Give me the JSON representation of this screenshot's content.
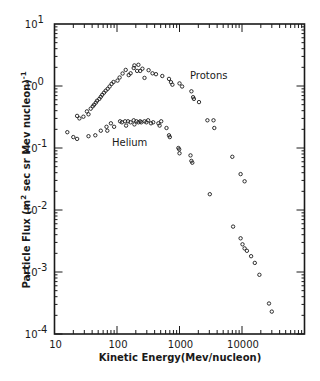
{
  "chart_data": {
    "type": "scatter",
    "title": "",
    "xlabel": "Kinetic Energy (Mev/nucleon)",
    "ylabel": "Particle Flux (m² sec sr Mev nucleon)⁻¹",
    "xscale": "log",
    "yscale": "log",
    "xlim": [
      10,
      100000
    ],
    "ylim": [
      0.0001,
      10
    ],
    "x_ticks": [
      10,
      100,
      1000,
      10000
    ],
    "x_tick_labels": [
      "10",
      "100",
      "1000",
      "10000"
    ],
    "y_ticks": [
      10,
      1,
      0.1,
      0.01,
      0.001,
      0.0001
    ],
    "y_tick_labels": [
      {
        "base": "10",
        "exp": "1"
      },
      {
        "base": "10",
        "exp": "0"
      },
      {
        "base": "10",
        "exp": "-1"
      },
      {
        "base": "10",
        "exp": "-2"
      },
      {
        "base": "10",
        "exp": "-3"
      },
      {
        "base": "10",
        "exp": "-4"
      }
    ],
    "grid": false,
    "legend": "none (inline series labels)",
    "annotations": [
      {
        "text": "Protons",
        "x": 1300,
        "y": 1.2
      },
      {
        "text": "Helium",
        "x": 200,
        "y": 0.115
      }
    ],
    "series": [
      {
        "name": "Protons",
        "marker": "open-circle",
        "points": [
          [
            23,
            0.33
          ],
          [
            25,
            0.3
          ],
          [
            29,
            0.32
          ],
          [
            33,
            0.39
          ],
          [
            35,
            0.35
          ],
          [
            38,
            0.43
          ],
          [
            41,
            0.47
          ],
          [
            43,
            0.5
          ],
          [
            46,
            0.54
          ],
          [
            48,
            0.58
          ],
          [
            52,
            0.62
          ],
          [
            55,
            0.67
          ],
          [
            58,
            0.72
          ],
          [
            62,
            0.78
          ],
          [
            66,
            0.84
          ],
          [
            71,
            0.9
          ],
          [
            76,
            0.98
          ],
          [
            82,
            1.08
          ],
          [
            88,
            1.16
          ],
          [
            102,
            1.22
          ],
          [
            110,
            1.37
          ],
          [
            123,
            1.59
          ],
          [
            138,
            1.82
          ],
          [
            154,
            1.5
          ],
          [
            165,
            1.6
          ],
          [
            185,
            1.95
          ],
          [
            190,
            2.15
          ],
          [
            210,
            1.75
          ],
          [
            220,
            2.2
          ],
          [
            235,
            1.75
          ],
          [
            255,
            1.9
          ],
          [
            275,
            1.35
          ],
          [
            320,
            1.8
          ],
          [
            370,
            1.6
          ],
          [
            420,
            1.55
          ],
          [
            530,
            1.45
          ],
          [
            680,
            1.3
          ],
          [
            730,
            1.15
          ],
          [
            770,
            1.05
          ],
          [
            1000,
            1.1
          ],
          [
            1100,
            0.98
          ],
          [
            1550,
            0.82
          ],
          [
            1650,
            0.66
          ],
          [
            1700,
            0.62
          ],
          [
            2050,
            0.55
          ],
          [
            2800,
            0.28
          ],
          [
            3500,
            0.28
          ],
          [
            3600,
            0.21
          ],
          [
            7000,
            0.072
          ],
          [
            9500,
            0.038
          ],
          [
            11000,
            0.029
          ]
        ]
      },
      {
        "name": "Helium",
        "marker": "open-circle",
        "points": [
          [
            16,
            0.18
          ],
          [
            20,
            0.15
          ],
          [
            23,
            0.14
          ],
          [
            35,
            0.155
          ],
          [
            45,
            0.16
          ],
          [
            55,
            0.19
          ],
          [
            68,
            0.22
          ],
          [
            70,
            0.19
          ],
          [
            80,
            0.25
          ],
          [
            90,
            0.22
          ],
          [
            112,
            0.27
          ],
          [
            120,
            0.26
          ],
          [
            135,
            0.27
          ],
          [
            140,
            0.23
          ],
          [
            150,
            0.27
          ],
          [
            165,
            0.26
          ],
          [
            185,
            0.28
          ],
          [
            190,
            0.24
          ],
          [
            205,
            0.27
          ],
          [
            220,
            0.26
          ],
          [
            235,
            0.27
          ],
          [
            245,
            0.26
          ],
          [
            275,
            0.27
          ],
          [
            295,
            0.26
          ],
          [
            315,
            0.28
          ],
          [
            350,
            0.25
          ],
          [
            380,
            0.26
          ],
          [
            460,
            0.25
          ],
          [
            480,
            0.23
          ],
          [
            510,
            0.27
          ],
          [
            620,
            0.21
          ],
          [
            680,
            0.16
          ],
          [
            700,
            0.15
          ],
          [
            960,
            0.1
          ],
          [
            990,
            0.095
          ],
          [
            1000,
            0.082
          ],
          [
            1500,
            0.076
          ],
          [
            1550,
            0.062
          ],
          [
            1600,
            0.058
          ],
          [
            3050,
            0.018
          ]
        ]
      },
      {
        "name": "High-energy tail",
        "marker": "open-circle",
        "points": [
          [
            7200,
            0.0054
          ],
          [
            9500,
            0.0035
          ],
          [
            10200,
            0.0028
          ],
          [
            11000,
            0.0024
          ],
          [
            12000,
            0.0022
          ],
          [
            14000,
            0.0018
          ],
          [
            16000,
            0.0014
          ],
          [
            19000,
            0.0009
          ],
          [
            27000,
            0.00031
          ],
          [
            30000,
            0.00023
          ]
        ]
      }
    ]
  },
  "labels": {
    "x_axis": "Kinetic Energy(Mev/nucleon)",
    "y_axis_main": "Particle  Flux (m",
    "y_axis_sup": "2",
    "y_axis_rest": " sec  sr  Mev  nucleon)",
    "y_axis_exp": "-1",
    "protons": "Protons",
    "helium": "Helium"
  },
  "colors": {
    "ink": "#1a1a1a",
    "background": "#ffffff"
  }
}
